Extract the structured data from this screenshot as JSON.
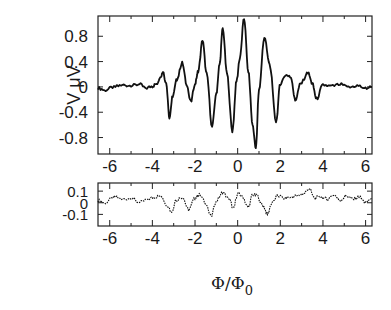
{
  "chart_data": [
    {
      "panel": "top",
      "type": "line",
      "title": "",
      "xlabel": "",
      "ylabel": "V μV",
      "xlim": [
        -6.55,
        6.3
      ],
      "ylim": [
        -1.06,
        1.12
      ],
      "xticks": [
        -6,
        -4,
        -2,
        0,
        2,
        4,
        6
      ],
      "xtick_labels": [
        "-6",
        "-4",
        "-2",
        "0",
        "2",
        "4",
        "6"
      ],
      "yticks": [
        0.8,
        0.4,
        0,
        -0.4,
        -0.8
      ],
      "ytick_labels": [
        "0.8",
        "0.4",
        "0",
        "-0.4",
        "-0.8"
      ],
      "grid": false,
      "legend": null,
      "series": [
        {
          "name": "V",
          "style": "solid",
          "x": [
            -6.55,
            -6.2,
            -5.8,
            -5.4,
            -5.0,
            -4.6,
            -4.3,
            -4.0,
            -3.8,
            -3.6,
            -3.5,
            -3.35,
            -3.2,
            -3.05,
            -2.85,
            -2.6,
            -2.4,
            -2.2,
            -2.0,
            -1.85,
            -1.65,
            -1.45,
            -1.2,
            -1.0,
            -0.85,
            -0.7,
            -0.5,
            -0.25,
            -0.05,
            0.1,
            0.3,
            0.5,
            0.7,
            0.85,
            1.0,
            1.25,
            1.5,
            1.8,
            2.0,
            2.25,
            2.5,
            2.7,
            2.95,
            3.3,
            3.5,
            3.7,
            4.0,
            4.4,
            4.8,
            5.2,
            5.6,
            6.0,
            6.3
          ],
          "y": [
            -0.02,
            -0.05,
            0.0,
            0.03,
            0.02,
            0.04,
            -0.02,
            0.01,
            0.05,
            0.18,
            0.24,
            0.05,
            -0.48,
            -0.15,
            0.12,
            0.38,
            0.05,
            -0.24,
            0.05,
            0.25,
            0.73,
            0.2,
            -0.63,
            -0.1,
            0.35,
            0.92,
            0.2,
            -0.7,
            0.1,
            0.45,
            1.08,
            0.25,
            -0.6,
            -0.97,
            -0.05,
            0.78,
            0.35,
            -0.55,
            0.05,
            0.19,
            0.15,
            -0.21,
            0.05,
            0.22,
            0.05,
            -0.19,
            0.03,
            0.01,
            0.04,
            -0.01,
            0.02,
            -0.02,
            0.0
          ]
        }
      ]
    },
    {
      "panel": "bottom",
      "type": "line",
      "title": "",
      "xlabel": "Φ/Φ",
      "xlabel_subscript": "0",
      "ylabel": "",
      "xlim": [
        -6.55,
        6.3
      ],
      "ylim": [
        -0.2,
        0.17
      ],
      "xticks": [
        -6,
        -4,
        -2,
        0,
        2,
        4,
        6
      ],
      "xtick_labels": [
        "-6",
        "-4",
        "-2",
        "0",
        "2",
        "4",
        "6"
      ],
      "yticks": [
        0.1,
        0,
        -0.1
      ],
      "ytick_labels": [
        "0.1",
        "0",
        "-0.1"
      ],
      "grid": false,
      "legend": null,
      "series": [
        {
          "name": "residual",
          "style": "dotted",
          "x": [
            -6.55,
            -6.2,
            -5.8,
            -5.4,
            -5.0,
            -4.6,
            -4.2,
            -3.9,
            -3.6,
            -3.3,
            -3.1,
            -2.9,
            -2.6,
            -2.3,
            -2.0,
            -1.8,
            -1.5,
            -1.25,
            -1.0,
            -0.7,
            -0.4,
            -0.2,
            0.0,
            0.2,
            0.5,
            0.7,
            0.9,
            1.2,
            1.4,
            1.6,
            1.9,
            2.2,
            2.5,
            2.8,
            3.1,
            3.35,
            3.6,
            3.9,
            4.2,
            4.5,
            4.8,
            5.1,
            5.4,
            5.7,
            6.0,
            6.3
          ],
          "y": [
            0.02,
            0.0,
            0.05,
            0.03,
            0.04,
            0.0,
            0.03,
            0.05,
            0.06,
            -0.02,
            -0.08,
            0.02,
            0.05,
            -0.06,
            0.04,
            0.07,
            0.0,
            -0.12,
            0.02,
            0.09,
            0.03,
            -0.05,
            0.08,
            0.06,
            -0.04,
            0.07,
            0.06,
            -0.03,
            -0.1,
            0.0,
            0.06,
            0.04,
            0.05,
            0.06,
            0.08,
            0.12,
            0.04,
            0.05,
            0.03,
            0.07,
            0.02,
            0.06,
            0.03,
            0.05,
            0.0,
            0.04
          ]
        }
      ]
    }
  ]
}
